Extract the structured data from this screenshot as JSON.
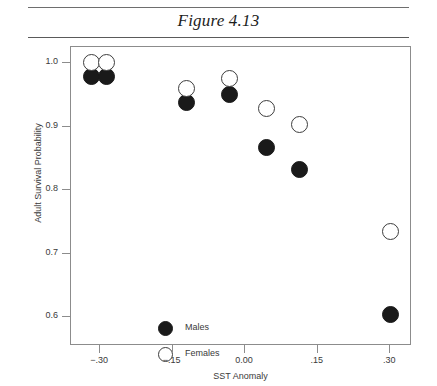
{
  "figure": {
    "title": "Figure 4.13"
  },
  "chart_data": {
    "type": "scatter",
    "title": "Figure 4.13",
    "xlabel": "SST Anomaly",
    "ylabel": "Adult Survival Probability",
    "xlim": [
      -0.36,
      0.345
    ],
    "ylim": [
      0.555,
      1.025
    ],
    "grid": false,
    "legend_position": "inside-lower-left",
    "xticks": [
      -0.3,
      -0.15,
      0.0,
      0.15,
      0.3
    ],
    "xtick_labels": [
      "−.30",
      "−.15",
      "0.00",
      ".15",
      ".30"
    ],
    "yticks": [
      0.6,
      0.7,
      0.8,
      0.9,
      1.0
    ],
    "ytick_labels": [
      "0.6",
      "0.7",
      "0.8",
      "0.9",
      "1.0"
    ],
    "series": [
      {
        "name": "Males",
        "marker": "filled-circle",
        "color": "#1a1a1a",
        "points": [
          {
            "x": -0.318,
            "y": 0.978
          },
          {
            "x": -0.286,
            "y": 0.978
          },
          {
            "x": -0.122,
            "y": 0.937
          },
          {
            "x": -0.033,
            "y": 0.95
          },
          {
            "x": 0.044,
            "y": 0.867
          },
          {
            "x": 0.113,
            "y": 0.833
          },
          {
            "x": 0.3,
            "y": 0.605
          }
        ]
      },
      {
        "name": "Females",
        "marker": "open-circle",
        "color": "#ffffff",
        "points": [
          {
            "x": -0.318,
            "y": 1.0
          },
          {
            "x": -0.286,
            "y": 1.0
          },
          {
            "x": -0.122,
            "y": 0.96
          },
          {
            "x": -0.033,
            "y": 0.975
          },
          {
            "x": 0.044,
            "y": 0.928
          },
          {
            "x": 0.113,
            "y": 0.903
          },
          {
            "x": 0.3,
            "y": 0.735
          }
        ]
      }
    ]
  },
  "legend": {
    "items": [
      {
        "label": "Males",
        "marker": "filled-circle"
      },
      {
        "label": "Females",
        "marker": "open-circle"
      }
    ]
  }
}
